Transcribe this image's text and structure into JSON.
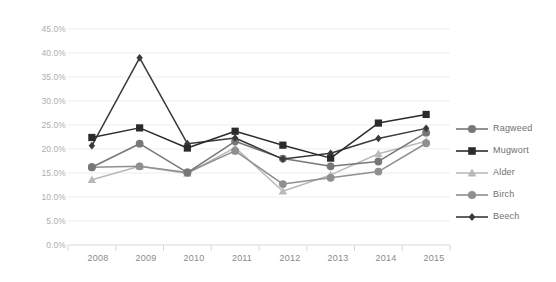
{
  "chart_data": {
    "type": "line",
    "title": "",
    "subtitle": "",
    "xlabel": "",
    "ylabel": "",
    "categories": [
      "2008",
      "2009",
      "2010",
      "2011",
      "2012",
      "2013",
      "2014",
      "2015"
    ],
    "ylim": [
      0,
      45
    ],
    "ytick_values": [
      0,
      5,
      10,
      15,
      20,
      25,
      30,
      35,
      40,
      45
    ],
    "ytick_labels": [
      "0.0%",
      "5.0%",
      "10.0%",
      "15.0%",
      "20.0%",
      "25.0%",
      "30.0%",
      "35.0%",
      "40.0%",
      "45.0%"
    ],
    "grid": true,
    "grid_axis": "y",
    "legend_position": "right",
    "value_format": "percent",
    "series": [
      {
        "name": "Ragweed",
        "marker": "circle",
        "color": "#777777",
        "values": [
          16.2,
          21.1,
          15.1,
          21.6,
          18.0,
          16.4,
          17.4,
          23.4
        ]
      },
      {
        "name": "Mugwort",
        "marker": "square",
        "color": "#2b2b2b",
        "values": [
          22.4,
          24.4,
          20.2,
          23.7,
          20.8,
          18.1,
          25.4,
          27.2
        ]
      },
      {
        "name": "Alder",
        "marker": "triangle",
        "color": "#b9b9b9",
        "values": [
          13.6,
          16.4,
          14.9,
          20.3,
          11.2,
          14.6,
          19.0,
          21.6
        ]
      },
      {
        "name": "Birch",
        "marker": "circle",
        "color": "#8f8f8f",
        "values": [
          16.2,
          16.4,
          15.1,
          19.6,
          12.7,
          14.0,
          15.3,
          21.2
        ]
      },
      {
        "name": "Beech",
        "marker": "diamond",
        "color": "#3a3a3a",
        "values": [
          20.7,
          39.0,
          21.1,
          22.3,
          17.9,
          19.1,
          22.2,
          24.3
        ]
      }
    ]
  },
  "legend": {
    "items": [
      {
        "label": "Ragweed"
      },
      {
        "label": "Mugwort"
      },
      {
        "label": "Alder"
      },
      {
        "label": "Birch"
      },
      {
        "label": "Beech"
      }
    ]
  },
  "colors": {
    "background": "#ffffff",
    "grid": "#ededed",
    "axis": "#d8d8d8",
    "ytick_text": "#aeaeae",
    "xtick_text": "#8a8a8a",
    "legend_text": "#6f6f6f"
  }
}
